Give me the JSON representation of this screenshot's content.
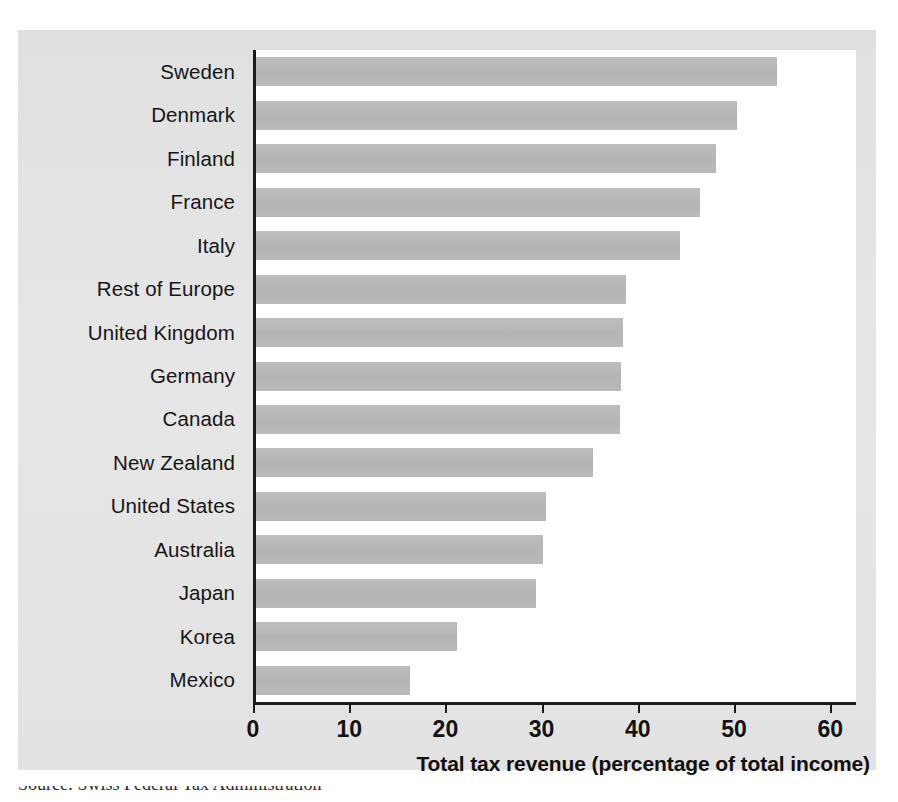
{
  "figure": {
    "background_color": "#ffffff",
    "panel_color": "#e3e3e3",
    "plot_color": "#ffffff",
    "axis_color": "#1b1b1b",
    "bar_color": "#b9b9b9",
    "source_note": "Source: Swiss Federal Tax Administration"
  },
  "chart_data": {
    "type": "bar",
    "orientation": "horizontal",
    "title": "",
    "xlabel": "Total tax revenue (percentage of total income)",
    "ylabel": "",
    "xlim": [
      0,
      63
    ],
    "xticks": [
      0,
      10,
      20,
      30,
      40,
      50,
      60
    ],
    "xtick_labels": [
      "0",
      "10",
      "20",
      "30",
      "40",
      "50",
      "60"
    ],
    "grid": false,
    "legend": false,
    "categories": [
      "Sweden",
      "Denmark",
      "Finland",
      "France",
      "Italy",
      "Rest of Europe",
      "United Kingdom",
      "Germany",
      "Canada",
      "New Zealand",
      "United States",
      "Australia",
      "Japan",
      "Korea",
      "Mexico"
    ],
    "values": [
      54.2,
      50.0,
      47.8,
      46.2,
      44.1,
      38.5,
      38.2,
      37.9,
      37.8,
      35.0,
      30.1,
      29.8,
      29.1,
      20.9,
      16.0
    ]
  }
}
